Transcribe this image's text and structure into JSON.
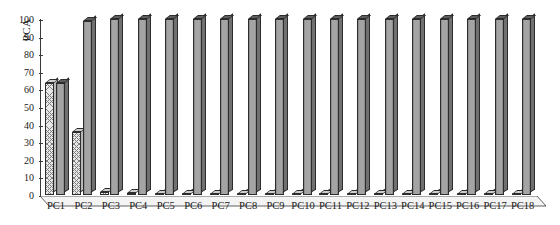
{
  "chart_data": {
    "type": "bar",
    "title": "",
    "xlabel": "",
    "ylabel": "PCA",
    "ylim": [
      0,
      100
    ],
    "yticks": [
      0,
      10,
      20,
      30,
      40,
      50,
      60,
      70,
      80,
      90,
      100
    ],
    "grid": false,
    "legend": "none",
    "categories": [
      "PC1",
      "PC2",
      "PC3",
      "PC4",
      "PC5",
      "PC6",
      "PC7",
      "PC8",
      "PC9",
      "PC10",
      "PC11",
      "PC12",
      "PC13",
      "PC14",
      "PC15",
      "PC16",
      "PC17",
      "PC18"
    ],
    "series": [
      {
        "name": "individual variance",
        "style": "hatched",
        "values": [
          63.4,
          35.6,
          1.5,
          1.0,
          0.8,
          0.7,
          0.6,
          0.5,
          0.5,
          0.4,
          0.4,
          0.4,
          0.3,
          0.3,
          0.3,
          0.3,
          0.2,
          0.2
        ]
      },
      {
        "name": "cumulative variance",
        "style": "solid-gray",
        "values": [
          63.6,
          99.0,
          100,
          100,
          100,
          100,
          100,
          100,
          100,
          100,
          100,
          100,
          100,
          100,
          100,
          100,
          100,
          100
        ]
      }
    ]
  },
  "axis": {
    "y_title": "PCA",
    "tick_labels": [
      "0",
      "10",
      "20",
      "30",
      "40",
      "50",
      "60",
      "70",
      "80",
      "90",
      "100"
    ]
  },
  "colors": {
    "bar_hatch_face": "#e8e8e8",
    "bar_hatch_line": "#7d7d7d",
    "bar_solid_face": "#9a9a9a",
    "bar_edge": "#2c2c2c",
    "axis": "#3a3a3a",
    "floor": "#f2f2f2",
    "text": "#1a1a1a"
  }
}
